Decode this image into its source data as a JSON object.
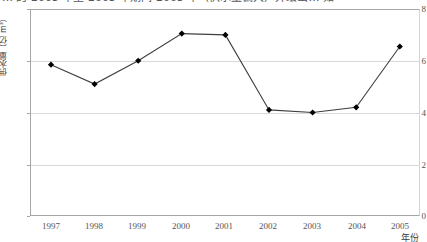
{
  "caption": {
    "text": "… 的 2005 年至 2005 年期间 2005 年（供水量偏大）并绘出… 如"
  },
  "chart_data": {
    "type": "line",
    "title": "",
    "xlabel": "年份",
    "ylabel": "供水量（亿 m³）",
    "categories": [
      "1997",
      "1998",
      "1999",
      "2000",
      "2001",
      "2002",
      "2003",
      "2004",
      "2005"
    ],
    "values": [
      5.85,
      5.1,
      6.0,
      7.05,
      7.0,
      4.1,
      4.0,
      4.2,
      6.55
    ],
    "series": [
      {
        "name": "供水量",
        "values": [
          5.85,
          5.1,
          6.0,
          7.05,
          7.0,
          4.1,
          4.0,
          4.2,
          6.55
        ]
      }
    ],
    "ylim": [
      0,
      8
    ],
    "y_ticks": [
      0,
      2,
      4,
      6,
      8
    ],
    "y_tick_labels": [
      "0",
      "2",
      "4",
      "6",
      "8"
    ],
    "gridlines": [
      2,
      4,
      6
    ],
    "grid": true,
    "legend": null,
    "legend_position": "none",
    "marker": "diamond",
    "line_color": "#3f3f3f",
    "marker_color": "#000000",
    "grid_color": "#d9d9d9",
    "axis_color": "#a6a6a6"
  }
}
